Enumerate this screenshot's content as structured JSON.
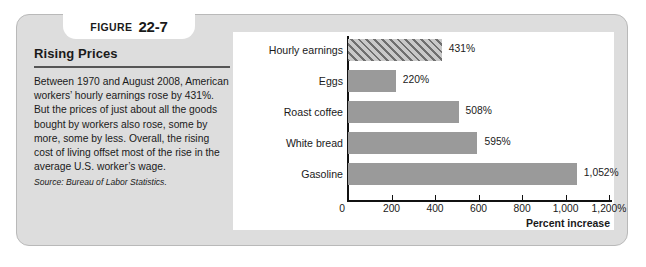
{
  "figure": {
    "label": "FIGURE",
    "number": "22-7"
  },
  "caption": {
    "title": "Rising Prices",
    "body": "Between 1970 and August 2008, American workers’ hourly earnings rose by 431%. But the prices of just about all the goods bought by workers also rose, some by more, some by less. Overall, the rising cost of living offset most of the rise in the average U.S. worker’s wage.",
    "source": "Source: Bureau of Labor Statistics."
  },
  "chart_data": {
    "type": "bar",
    "orientation": "horizontal",
    "title": "Rising Prices",
    "xlabel": "Percent increase",
    "ylabel": "",
    "xlim": [
      0,
      1200
    ],
    "grid": false,
    "legend": "none",
    "categories": [
      "Hourly earnings",
      "Eggs",
      "Roast coffee",
      "White bread",
      "Gasoline"
    ],
    "values": [
      431,
      220,
      508,
      595,
      1052
    ],
    "value_labels": [
      "431%",
      "220%",
      "508%",
      "595%",
      "1,052%"
    ],
    "bar_styles": [
      "hatched",
      "solid",
      "solid",
      "solid",
      "solid"
    ],
    "tick_values": [
      0,
      200,
      400,
      600,
      800,
      1000,
      1200
    ],
    "tick_labels": [
      "0",
      "200",
      "400",
      "600",
      "800",
      "1,000",
      "1,200%"
    ],
    "colors": {
      "bar_fill": "#9a9a9a",
      "hatch_dark": "#6f6f6f",
      "hatch_light": "#c9c9c9",
      "axis": "#111111",
      "panel_bg": "#ffffff",
      "card_bg": "#dddddd"
    }
  }
}
